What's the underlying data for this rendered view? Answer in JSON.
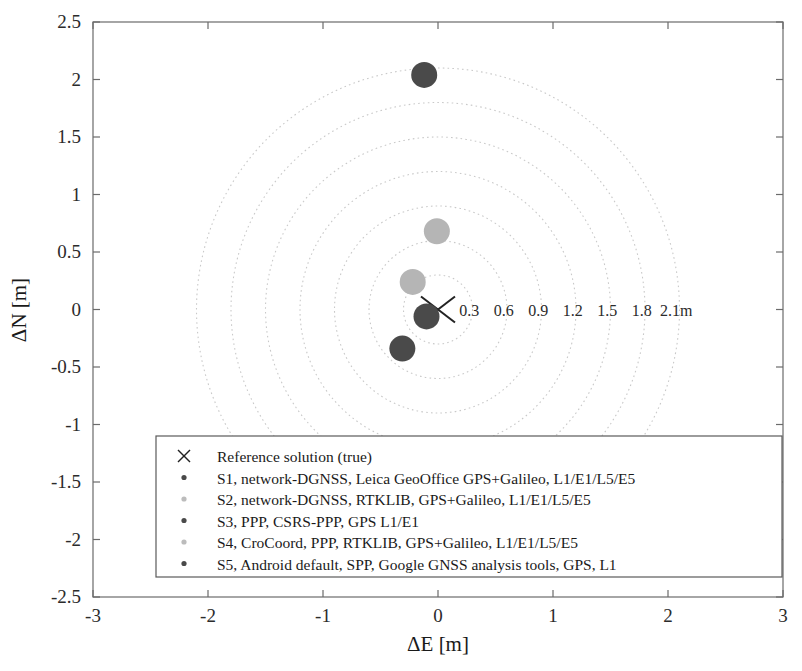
{
  "chart_data": {
    "type": "scatter",
    "title": "",
    "xlabel": "ΔE [m]",
    "ylabel": "ΔN [m]",
    "xlim": [
      -3,
      3
    ],
    "ylim": [
      -2.5,
      2.5
    ],
    "xticks": [
      "-3",
      "-2",
      "-1",
      "0",
      "1",
      "2",
      "3"
    ],
    "xtick_values": [
      -3,
      -2,
      -1,
      0,
      1,
      2,
      3
    ],
    "yticks": [
      "-2.5",
      "-2",
      "-1.5",
      "-1",
      "-0.5",
      "0",
      "0.5",
      "1",
      "1.5",
      "2",
      "2.5"
    ],
    "ytick_values": [
      -2.5,
      -2,
      -1.5,
      -1,
      -0.5,
      0,
      0.5,
      1,
      1.5,
      2,
      2.5
    ],
    "grid": false,
    "legend_position": "lower-center",
    "radial_rings": {
      "unit": "m",
      "radii": [
        0.3,
        0.6,
        0.9,
        1.2,
        1.5,
        1.8,
        2.1
      ],
      "labels": [
        "0.3",
        "0.6",
        "0.9",
        "1.2",
        "1.5",
        "1.8",
        "2.1m"
      ],
      "style": "dotted",
      "color": "#c9c9c9"
    },
    "series": [
      {
        "name": "Reference solution (true)",
        "marker": "x",
        "color": "#222222",
        "points": [
          {
            "x": 0.0,
            "y": 0.0
          }
        ]
      },
      {
        "name": "S1, network-DGNSS, Leica GeoOffice GPS+Galileo, L1/E1/L5/E5",
        "marker": "o",
        "color": "#4a4a4a",
        "points": [
          {
            "x": -0.1,
            "y": -0.06
          }
        ]
      },
      {
        "name": "S2, network-DGNSS, RTKLIB, GPS+Galileo, L1/E1/L5/E5",
        "marker": "o",
        "color": "#b5b5b5",
        "points": [
          {
            "x": -0.22,
            "y": 0.24
          }
        ]
      },
      {
        "name": "S3, PPP, CSRS-PPP, GPS L1/E1",
        "marker": "o",
        "color": "#4a4a4a",
        "points": [
          {
            "x": -0.31,
            "y": -0.34
          }
        ]
      },
      {
        "name": "S4, CroCoord, PPP, RTKLIB, GPS+Galileo, L1/E1/L5/E5",
        "marker": "o",
        "color": "#b5b5b5",
        "points": [
          {
            "x": -0.01,
            "y": 0.68
          }
        ]
      },
      {
        "name": "S5, Android default, SPP, Google GNSS analysis tools, GPS, L1",
        "marker": "o",
        "color": "#4a4a4a",
        "points": [
          {
            "x": -0.12,
            "y": 2.04
          }
        ]
      }
    ]
  },
  "axes": {
    "x_title": "ΔE [m]",
    "y_title": "ΔN [m]"
  },
  "legend": {
    "entries": [
      {
        "label": "Reference solution (true)",
        "marker": "x",
        "color": "#222222"
      },
      {
        "label": "S1, network-DGNSS, Leica GeoOffice GPS+Galileo, L1/E1/L5/E5",
        "marker": "dot",
        "color": "#4a4a4a"
      },
      {
        "label": "S2, network-DGNSS, RTKLIB, GPS+Galileo, L1/E1/L5/E5",
        "marker": "dot",
        "color": "#bcbcbc"
      },
      {
        "label": "S3, PPP, CSRS-PPP, GPS L1/E1",
        "marker": "dot",
        "color": "#4a4a4a"
      },
      {
        "label": "S4, CroCoord, PPP, RTKLIB, GPS+Galileo, L1/E1/L5/E5",
        "marker": "dot",
        "color": "#bcbcbc"
      },
      {
        "label": "S5, Android default, SPP, Google GNSS analysis tools, GPS, L1",
        "marker": "dot",
        "color": "#4a4a4a"
      }
    ]
  }
}
